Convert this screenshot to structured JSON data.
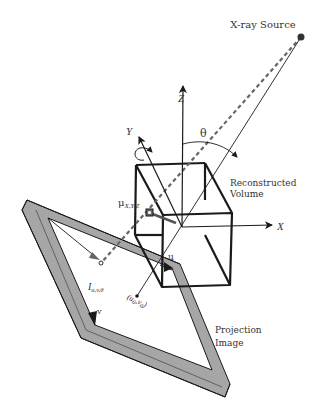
{
  "diagram": {
    "labels": {
      "xray_source": "X-ray Source",
      "theta": "θ",
      "axis_x": "X",
      "axis_y": "Y",
      "axis_z": "Z",
      "recon_volume_line1": "Reconstructed",
      "recon_volume_line2": "Volume",
      "mu": "μ",
      "mu_sub": "X,Y,Z",
      "detector_pixel": "I",
      "detector_pixel_sub": "u,v,θ",
      "axis_u": "u",
      "axis_v": "v",
      "principal_point": "(u",
      "principal_point_sub0": "0",
      "principal_point_mid": ",v",
      "principal_point_sub1": "0",
      "principal_point_end": ")",
      "projection_image_line1": "Projection",
      "projection_image_line2": "Image"
    },
    "colors": {
      "line": "#1a1a1a",
      "frame_fill": "#a6a6a6",
      "dash": "#666666",
      "text": "#333333"
    }
  }
}
